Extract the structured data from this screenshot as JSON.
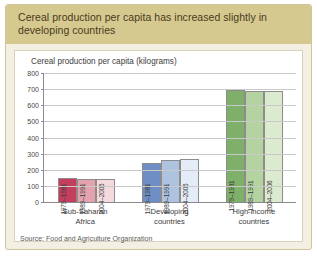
{
  "banner": {
    "title": "Cereal production per capita has increased slightly in developing countries"
  },
  "source": {
    "text": "Source: Food and Agriculture Organization"
  },
  "chart_data": {
    "type": "bar",
    "title": "Cereal production per capita (kilograms)",
    "xlabel": "",
    "ylabel": "Cereal production per capita (kilograms)",
    "ylim": [
      0,
      800
    ],
    "yticks": [
      0,
      100,
      200,
      300,
      400,
      500,
      600,
      700,
      800
    ],
    "ytick_labels": [
      "0",
      "100",
      "200",
      "300",
      "400",
      "500",
      "600",
      "700",
      "800"
    ],
    "grid": true,
    "legend": "none",
    "categories": [
      "Sub-Saharan Africa",
      "Developing countries",
      "High-income countries"
    ],
    "category_lines": [
      [
        "Sub-Saharan",
        "Africa"
      ],
      [
        "Developing",
        "countries"
      ],
      [
        "High-income",
        "countries"
      ]
    ],
    "series": [
      {
        "name": "1979–1981",
        "values": [
          150,
          245,
          695
        ],
        "colors": [
          "#c43f5e",
          "#6f8fc4",
          "#7fb069"
        ]
      },
      {
        "name": "1989–1991",
        "values": [
          145,
          258,
          690
        ],
        "colors": [
          "#e3a2ad",
          "#aec3e0",
          "#b4d3a0"
        ]
      },
      {
        "name": "2004–2006",
        "values": [
          141,
          268,
          688
        ],
        "colors": [
          "#f5dadd",
          "#e3ecf7",
          "#dcebd0"
        ]
      }
    ],
    "groups": [
      {
        "category": "Sub-Saharan Africa",
        "bars": [
          {
            "label": "1979–1981",
            "value": 150,
            "color": "#c43f5e"
          },
          {
            "label": "1989–1991",
            "value": 145,
            "color": "#e3a2ad"
          },
          {
            "label": "2004–2006",
            "value": 141,
            "color": "#f5dadd"
          }
        ]
      },
      {
        "category": "Developing countries",
        "bars": [
          {
            "label": "1979–1981",
            "value": 245,
            "color": "#6f8fc4"
          },
          {
            "label": "1989–1991",
            "value": 258,
            "color": "#aec3e0"
          },
          {
            "label": "2004–2006",
            "value": 268,
            "color": "#e3ecf7"
          }
        ]
      },
      {
        "category": "High-income countries",
        "bars": [
          {
            "label": "1979–1981",
            "value": 695,
            "color": "#7fb069"
          },
          {
            "label": "1989–1991",
            "value": 690,
            "color": "#b4d3a0"
          },
          {
            "label": "2004–2006",
            "value": 688,
            "color": "#dcebd0"
          }
        ]
      }
    ]
  },
  "colors": {
    "banner_bg": "#d5c98f",
    "card_bg": "#f3efe2",
    "card_border": "#cfc49b",
    "panel_bg": "#ffffff",
    "axis": "#8a8a8a",
    "grid": "#c9c9c9"
  }
}
